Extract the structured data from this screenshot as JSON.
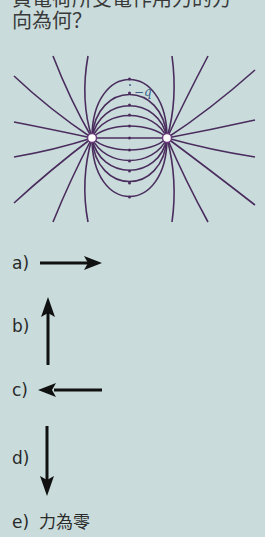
{
  "question": {
    "line1": "負電荷所受電作用力的方",
    "line2": "向為何？"
  },
  "figure": {
    "test_charge_label": "−q",
    "line_color": "#4a2d5e",
    "charge_color": "#ffffff",
    "label_color": "#3b5f8a"
  },
  "options": [
    {
      "label": "a)",
      "direction": "right",
      "icon": "arrow-right-icon"
    },
    {
      "label": "b)",
      "direction": "up",
      "icon": "arrow-up-icon"
    },
    {
      "label": "c)",
      "direction": "left",
      "icon": "arrow-left-icon"
    },
    {
      "label": "d)",
      "direction": "down",
      "icon": "arrow-down-icon"
    },
    {
      "label": "e)",
      "text": "力為零"
    }
  ],
  "colors": {
    "panel_bg": "#c9dcdb",
    "arrow": "#111111",
    "text": "#2a2a2a"
  }
}
